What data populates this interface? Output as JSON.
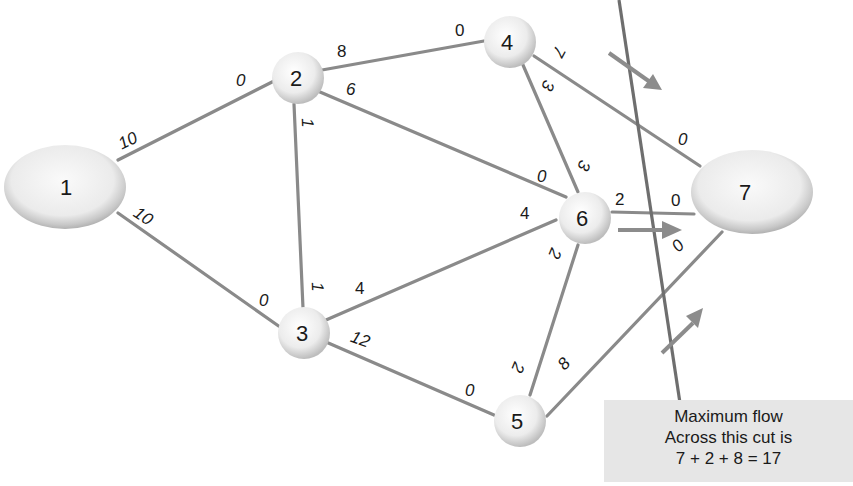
{
  "diagram": {
    "nodes": [
      {
        "id": "1",
        "label": "1",
        "shape": "ellipse",
        "role": "source"
      },
      {
        "id": "2",
        "label": "2",
        "shape": "circle"
      },
      {
        "id": "3",
        "label": "3",
        "shape": "circle"
      },
      {
        "id": "4",
        "label": "4",
        "shape": "circle"
      },
      {
        "id": "5",
        "label": "5",
        "shape": "circle"
      },
      {
        "id": "6",
        "label": "6",
        "shape": "circle"
      },
      {
        "id": "7",
        "label": "7",
        "shape": "ellipse",
        "role": "sink"
      }
    ],
    "edges": [
      {
        "from": "1",
        "to": "2",
        "cap_from": "10",
        "cap_to": "0"
      },
      {
        "from": "1",
        "to": "3",
        "cap_from": "10",
        "cap_to": "0"
      },
      {
        "from": "2",
        "to": "4",
        "cap_from": "8",
        "cap_to": "0"
      },
      {
        "from": "2",
        "to": "6",
        "cap_from": "6",
        "cap_to": "0"
      },
      {
        "from": "2",
        "to": "3",
        "cap_from": "1",
        "cap_to": "1"
      },
      {
        "from": "3",
        "to": "6",
        "cap_from": "4",
        "cap_to": "4"
      },
      {
        "from": "3",
        "to": "5",
        "cap_from": "12",
        "cap_to": "0"
      },
      {
        "from": "4",
        "to": "6",
        "cap_from": "3",
        "cap_to": "3"
      },
      {
        "from": "4",
        "to": "7",
        "cap_from": "7",
        "cap_to": "0"
      },
      {
        "from": "6",
        "to": "7",
        "cap_from": "2",
        "cap_to": "0"
      },
      {
        "from": "6",
        "to": "5",
        "cap_from": "2",
        "cap_to": "2"
      },
      {
        "from": "5",
        "to": "7",
        "cap_from": "8",
        "cap_to": "0"
      }
    ],
    "cut": {
      "crossing_edges": [
        "4-7",
        "6-7",
        "5-7"
      ],
      "arrows": 3
    },
    "caption": {
      "line1": "Maximum flow",
      "line2": "Across this cut is",
      "line3": "7 + 2 + 8 = 17"
    },
    "colors": {
      "edge": "#8a8a8a",
      "node_fill": "#eeeeee",
      "node_rim": "#b5b5b5",
      "caption_bg": "#e6e6e6",
      "text": "#1a1a1a"
    }
  }
}
